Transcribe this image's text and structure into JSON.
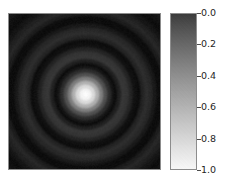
{
  "figure": {
    "background_color": "#ffffff",
    "width": 231,
    "height": 183
  },
  "image_axes": {
    "name": "heatmap-image",
    "left": 8,
    "top": 13,
    "width": 153,
    "height": 157,
    "frame_color": "#8c8c8c",
    "xticks": [],
    "yticks": [],
    "xticklabels": [],
    "yticklabels": []
  },
  "colorbar": {
    "left": 170,
    "top": 13,
    "width": 27,
    "height": 157,
    "frame_color": "#8c8c8c",
    "orientation": "vertical",
    "inverted": true,
    "top_value": "0.0",
    "bottom_value": "1.0",
    "top_color": "#3c3c3c",
    "bottom_color": "#f7f7f7",
    "ticks": [
      {
        "label": "0.0",
        "value": 0.0,
        "y": 13
      },
      {
        "label": "0.2",
        "value": 0.2,
        "y": 44.4
      },
      {
        "label": "0.4",
        "value": 0.4,
        "y": 75.8
      },
      {
        "label": "0.6",
        "value": 0.6,
        "y": 107.2
      },
      {
        "label": "0.8",
        "value": 0.8,
        "y": 138.6
      },
      {
        "label": "1.0",
        "value": 1.0,
        "y": 170
      }
    ]
  },
  "chart_data": {
    "type": "heatmap",
    "title": "",
    "xlabel": "",
    "ylabel": "",
    "colormap": "gray_r",
    "colorbar_label": "",
    "clim": [
      0.0,
      1.0
    ],
    "colorbar_ticks": [
      0.0,
      0.2,
      0.4,
      0.6,
      0.8,
      1.0
    ],
    "colorbar_ticklabels": [
      "0.0",
      "0.2",
      "0.4",
      "0.6",
      "0.8",
      "1.0"
    ],
    "grid": false,
    "legend": false,
    "pattern": "concentric-circular-diffraction-rings",
    "center": {
      "x_px": 85,
      "y_px": 94,
      "x_frac": 0.503,
      "y_frac": 0.516
    },
    "nx": 153,
    "ny": 157,
    "radial_profile": {
      "note": "Normalized intensity (0=dark background, 1=peak) sampled radially outward from the bright center in pixel units.",
      "radius_px": [
        0,
        4,
        8,
        12,
        16,
        20,
        24,
        28,
        30,
        34,
        38,
        42,
        46,
        50,
        54,
        58,
        62,
        66,
        70,
        74,
        78,
        82,
        86,
        90,
        95,
        100,
        105,
        110
      ],
      "intensity": [
        1.0,
        0.95,
        0.82,
        0.62,
        0.4,
        0.22,
        0.1,
        0.03,
        0.01,
        0.06,
        0.13,
        0.12,
        0.07,
        0.02,
        0.01,
        0.07,
        0.1,
        0.08,
        0.04,
        0.01,
        0.01,
        0.05,
        0.08,
        0.06,
        0.03,
        0.01,
        0.02,
        0.04
      ]
    },
    "rings": [
      {
        "order": 0,
        "kind": "central-maximum",
        "radius_px": 0,
        "peak_intensity": 1.0
      },
      {
        "order": 1,
        "kind": "minimum",
        "radius_px": 29,
        "peak_intensity": 0.01
      },
      {
        "order": 1,
        "kind": "maximum",
        "radius_px": 38,
        "peak_intensity": 0.13
      },
      {
        "order": 2,
        "kind": "minimum",
        "radius_px": 51,
        "peak_intensity": 0.01
      },
      {
        "order": 2,
        "kind": "maximum",
        "radius_px": 61,
        "peak_intensity": 0.1
      },
      {
        "order": 3,
        "kind": "minimum",
        "radius_px": 74,
        "peak_intensity": 0.01
      },
      {
        "order": 3,
        "kind": "maximum",
        "radius_px": 85,
        "peak_intensity": 0.08
      },
      {
        "order": 4,
        "kind": "minimum",
        "radius_px": 98,
        "peak_intensity": 0.01
      },
      {
        "order": 4,
        "kind": "maximum",
        "radius_px": 110,
        "peak_intensity": 0.05
      }
    ]
  }
}
